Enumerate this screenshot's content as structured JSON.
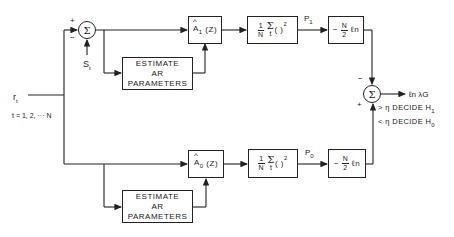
{
  "diagram": {
    "input": {
      "signal": "r",
      "signal_sub": "t",
      "index_range": "t = 1, 2, ··· N"
    },
    "reference": {
      "signal": "S",
      "signal_sub": "t"
    },
    "input_sum": {
      "symbol": "Σ",
      "plus": "+",
      "minus": "−"
    },
    "upper_branch": {
      "filter": {
        "hat": "^",
        "label": "A",
        "sub": "1",
        "arg": "(Z)"
      },
      "estimator": {
        "line1": "ESTIMATE",
        "line2": "AR",
        "line3": "PARAMETERS"
      },
      "power": {
        "num": "1",
        "den": "N",
        "sum": "Σ",
        "sum_sub": "t",
        "paren": "( )",
        "exp": "2"
      },
      "power_out": {
        "label": "P",
        "sub": "1"
      },
      "log": {
        "sign": "−",
        "num": "N",
        "den": "2",
        "fn": "ℓn"
      }
    },
    "lower_branch": {
      "filter": {
        "hat": "^",
        "label": "A",
        "sub": "0",
        "arg": "(Z)"
      },
      "estimator": {
        "line1": "ESTIMATE",
        "line2": "AR",
        "line3": "PARAMETERS"
      },
      "power": {
        "num": "1",
        "den": "N",
        "sum": "Σ",
        "sum_sub": "t",
        "paren": "( )",
        "exp": "2"
      },
      "power_out": {
        "label": "P",
        "sub": "0"
      },
      "log": {
        "sign": "−",
        "num": "N",
        "den": "2",
        "fn": "ℓn"
      }
    },
    "output_sum": {
      "symbol": "Σ",
      "minus": "−",
      "plus": "+"
    },
    "output": {
      "label": "ℓn λG"
    },
    "decision": {
      "h1": "> η DECIDE H",
      "h1_sub": "1",
      "h0": "< η DECIDE H",
      "h0_sub": "0"
    },
    "colors": {
      "line": "#222222",
      "background": "#ffffff"
    }
  }
}
